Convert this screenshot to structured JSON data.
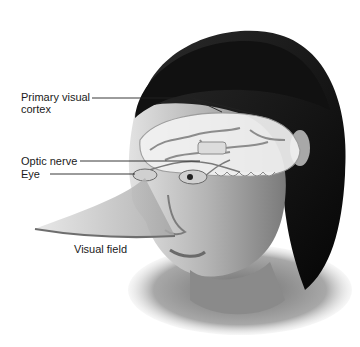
{
  "diagram": {
    "labels": [
      {
        "id": "primary-visual-cortex",
        "line1": "Primary visual",
        "line2": "cortex"
      },
      {
        "id": "optic-nerve",
        "line1": "Optic nerve"
      },
      {
        "id": "eye",
        "line1": "Eye"
      },
      {
        "id": "visual-field",
        "line1": "Visual field"
      }
    ],
    "colors": {
      "background": "#ffffff",
      "hair": "#0d0d0d",
      "skin_light": "#d9d9d9",
      "skin_mid": "#9a9a9a",
      "skin_dark": "#5a5a5a",
      "brain_light": "#efefef",
      "brain_shadow": "#8c8c8c",
      "visual_field": "#bdbdbd",
      "leader_line": "#222222"
    }
  }
}
